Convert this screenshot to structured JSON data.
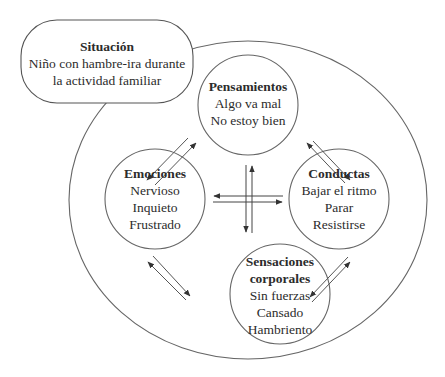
{
  "colors": {
    "stroke": "#555555",
    "arrow": "#333333",
    "text": "#2c2c2c",
    "background": "#ffffff"
  },
  "situation": {
    "title": "Situación",
    "lines": [
      "Niño con hambre-ira durante",
      "la actividad familiar"
    ]
  },
  "nodes": {
    "thoughts": {
      "title": "Pensamientos",
      "lines": [
        "Algo va mal",
        "No estoy bien"
      ]
    },
    "emotions": {
      "title": "Emociones",
      "lines": [
        "Nervioso",
        "Inquieto",
        "Frustrado"
      ]
    },
    "behaviors": {
      "title": "Conductas",
      "lines": [
        "Bajar el ritmo",
        "Parar",
        "Resistirse"
      ]
    },
    "sensations": {
      "title_lines": [
        "Sensaciones",
        "corporales"
      ],
      "lines": [
        "Sin fuerzas",
        "Cansado",
        "Hambriento"
      ]
    }
  },
  "connections": [
    {
      "from": "thoughts",
      "to": "emotions",
      "type": "bidirectional"
    },
    {
      "from": "thoughts",
      "to": "behaviors",
      "type": "bidirectional"
    },
    {
      "from": "emotions",
      "to": "sensations",
      "type": "bidirectional"
    },
    {
      "from": "behaviors",
      "to": "sensations",
      "type": "bidirectional"
    },
    {
      "from": "thoughts",
      "to": "sensations",
      "type": "bidirectional"
    },
    {
      "from": "emotions",
      "to": "behaviors",
      "type": "bidirectional"
    }
  ]
}
